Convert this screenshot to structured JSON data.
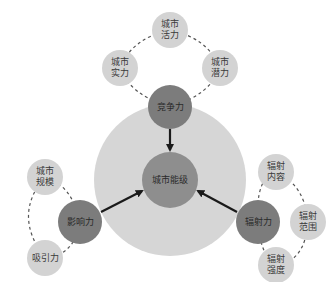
{
  "colors": {
    "big_circle": "#d6d6d6",
    "core_circle": "#8e8e8e",
    "force_circle": "#7c7c7c",
    "satellite_circle": "#d3d3d3",
    "arrow": "#1a1a1a",
    "dashed_line": "#555555"
  },
  "core": {
    "label": "城市能级"
  },
  "forces": [
    {
      "id": "competitiveness",
      "label": "竞争力"
    },
    {
      "id": "influence",
      "label": "影响力"
    },
    {
      "id": "radiation",
      "label": "辐射力"
    }
  ],
  "satellites": {
    "competitiveness": [
      {
        "label": "城市\n活力"
      },
      {
        "label": "城市\n实力"
      },
      {
        "label": "城市\n潜力"
      }
    ],
    "influence": [
      {
        "label": "城市\n规模"
      },
      {
        "label": "吸引力"
      }
    ],
    "radiation": [
      {
        "label": "辐射\n内容"
      },
      {
        "label": "辐射\n范围"
      },
      {
        "label": "辐射\n强度"
      }
    ]
  }
}
